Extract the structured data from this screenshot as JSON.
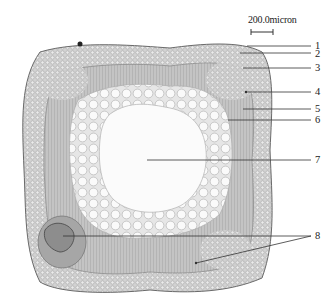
{
  "figure": {
    "type": "micrograph",
    "scale_bar": {
      "label": "200.0micron"
    },
    "labels": [
      {
        "id": "1",
        "text": "1",
        "target": [
          247,
          46
        ],
        "anchor": [
          313,
          46
        ]
      },
      {
        "id": "2",
        "text": "2",
        "target": [
          240,
          53
        ],
        "anchor": [
          313,
          53
        ]
      },
      {
        "id": "3",
        "text": "3",
        "target": [
          243,
          68
        ],
        "anchor": [
          313,
          68
        ]
      },
      {
        "id": "4",
        "text": "4",
        "target": [
          245,
          92
        ],
        "anchor": [
          313,
          92
        ]
      },
      {
        "id": "5",
        "text": "5",
        "target": [
          243,
          109
        ],
        "anchor": [
          313,
          109
        ]
      },
      {
        "id": "6",
        "text": "6",
        "target": [
          228,
          120
        ],
        "anchor": [
          313,
          120
        ]
      },
      {
        "id": "7",
        "text": "7",
        "target": [
          147,
          160
        ],
        "anchor": [
          313,
          160
        ]
      },
      {
        "id": "8",
        "text": "8",
        "targets": [
          [
            63,
            236
          ],
          [
            196,
            263
          ]
        ],
        "anchor": [
          313,
          236
        ]
      }
    ]
  },
  "colors": {
    "background": "#ffffff",
    "tissue": "#b9b9b9",
    "tissue_dark": "#8a8a8a",
    "pith": "#f3f3f3",
    "line": "#333333"
  }
}
